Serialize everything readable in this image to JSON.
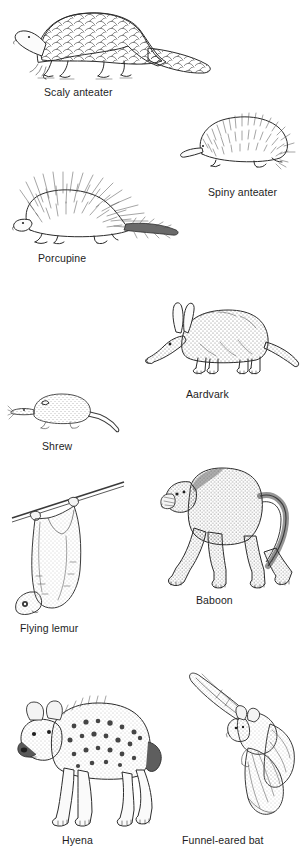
{
  "plate": {
    "title": "Mammal line-drawing plate",
    "background_color": "#ffffff",
    "ink_color": "#2b2b2b",
    "caption_color": "#1d1d1d",
    "figure_count": 9
  },
  "figures": [
    {
      "id": "scaly-anteater",
      "caption": "Scaly anteater",
      "subject": "pangolin walking left, overlapping keeled scales, long tapering scaled tail, clawed forefeet",
      "technique": "pen-and-ink outline with scale hatching",
      "position": "top-left",
      "x": 8,
      "y": 4,
      "w": 210,
      "h": 80
    },
    {
      "id": "spiny-anteater",
      "caption": "Spiny anteater",
      "subject": "echidna facing left, dense spines over rounded body, tubular snout, short legs",
      "technique": "pen-and-ink spine strokes",
      "position": "upper-right",
      "x": 176,
      "y": 108,
      "w": 120,
      "h": 62
    },
    {
      "id": "porcupine",
      "caption": "Porcupine",
      "subject": "porcupine facing left with long erect quills radiating from back and a quilled tail",
      "technique": "pen-and-ink radiating quill strokes",
      "position": "upper-left",
      "x": 8,
      "y": 172,
      "w": 175,
      "h": 76
    },
    {
      "id": "aardvark",
      "caption": "Aardvark",
      "subject": "aardvark standing in profile facing left, long rabbit-like ears, pig snout, thick tapering tail",
      "technique": "stipple shading",
      "position": "middle-right",
      "x": 140,
      "y": 296,
      "w": 160,
      "h": 78
    },
    {
      "id": "shrew",
      "caption": "Shrew",
      "subject": "shrew in profile facing left, pointed snout with whiskers, long bare tail",
      "technique": "fine stipple",
      "position": "middle-left",
      "x": 8,
      "y": 386,
      "w": 120,
      "h": 48
    },
    {
      "id": "flying-lemur",
      "caption": "Flying lemur",
      "subject": "colugo hanging upside down from a branch, broad gliding membrane stretched between limbs",
      "technique": "stipple with outline",
      "position": "lower-left",
      "x": 8,
      "y": 466,
      "w": 120,
      "h": 150
    },
    {
      "id": "baboon",
      "caption": "Baboon",
      "subject": "baboon walking on all fours facing left, long muzzle, arched tail",
      "technique": "dense stipple shading",
      "position": "lower-right",
      "x": 156,
      "y": 452,
      "w": 140,
      "h": 140
    },
    {
      "id": "hyena",
      "caption": "Hyena",
      "subject": "spotted hyena standing facing left, sloping back, rounded ears, spotted coat, bushy neck mane",
      "technique": "stipple with spot marks",
      "position": "bottom-left",
      "x": 8,
      "y": 668,
      "w": 160,
      "h": 160
    },
    {
      "id": "funnel-eared-bat",
      "caption": "Funnel-eared bat",
      "subject": "bat in flight, wings spread downward, large funnel-shaped ears, long tail membrane",
      "technique": "stipple with membrane outline",
      "position": "bottom-right",
      "x": 178,
      "y": 662,
      "w": 118,
      "h": 166
    }
  ]
}
